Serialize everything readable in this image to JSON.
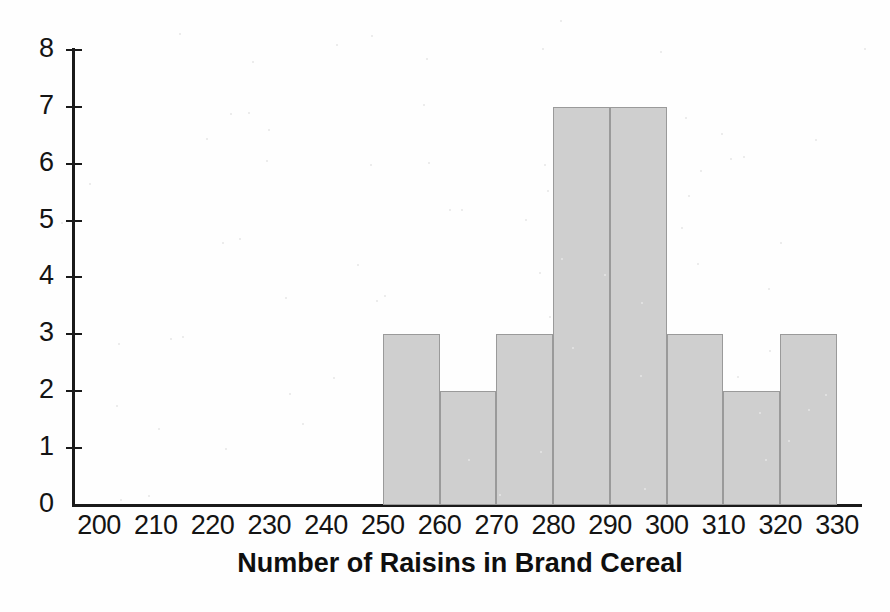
{
  "chart_data": {
    "type": "bar",
    "title": "",
    "xlabel": "Number of Raisins in Brand Cereal",
    "ylabel": "",
    "xlim": [
      200,
      330
    ],
    "ylim": [
      0,
      8
    ],
    "grid": false,
    "legend_position": "none",
    "bin_width": 10,
    "xtick_labels": [
      "200",
      "210",
      "220",
      "230",
      "240",
      "250",
      "260",
      "270",
      "280",
      "290",
      "300",
      "310",
      "320",
      "330"
    ],
    "ytick_labels": [
      "0",
      "1",
      "2",
      "3",
      "4",
      "5",
      "6",
      "7",
      "8"
    ],
    "bin_edges": [
      200,
      210,
      220,
      230,
      240,
      250,
      260,
      270,
      280,
      290,
      300,
      310,
      320,
      330
    ],
    "categories": [
      "200-210",
      "210-220",
      "220-230",
      "230-240",
      "240-250",
      "250-260",
      "260-270",
      "270-280",
      "280-290",
      "290-300",
      "300-310",
      "310-320",
      "320-330"
    ],
    "values": [
      0,
      0,
      0,
      0,
      0,
      3,
      2,
      3,
      7,
      7,
      3,
      2,
      3
    ],
    "bars": [
      {
        "bin_start": 250,
        "bin_end": 260,
        "value": 3
      },
      {
        "bin_start": 260,
        "bin_end": 270,
        "value": 2
      },
      {
        "bin_start": 270,
        "bin_end": 280,
        "value": 3
      },
      {
        "bin_start": 280,
        "bin_end": 290,
        "value": 7
      },
      {
        "bin_start": 290,
        "bin_end": 300,
        "value": 7
      },
      {
        "bin_start": 300,
        "bin_end": 310,
        "value": 3
      },
      {
        "bin_start": 310,
        "bin_end": 320,
        "value": 2
      },
      {
        "bin_start": 320,
        "bin_end": 330,
        "value": 3
      }
    ],
    "total_count": 30,
    "colors": {
      "bar_fill": "#cfcfcf",
      "bar_stroke": "#9a9a9a",
      "axis": "#1a1a1a",
      "text": "#141414",
      "background": "#fefefe"
    }
  }
}
